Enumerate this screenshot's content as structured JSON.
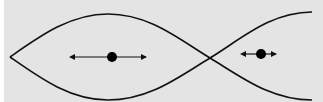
{
  "diagram": {
    "type": "standing-wave-mode",
    "colors": {
      "background": "#e4e4e4",
      "stroke": "#111111"
    },
    "particles": [
      {
        "name": "antinode-particle",
        "cx": 112,
        "cy": 57,
        "r": 5,
        "arrow_left": 72,
        "arrow_right": 147
      },
      {
        "name": "small-amplitude-particle",
        "cx": 261,
        "cy": 54,
        "r": 5,
        "arrow_left": 244,
        "arrow_right": 276
      }
    ]
  }
}
